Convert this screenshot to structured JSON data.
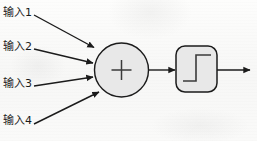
{
  "diagram": {
    "kind": "artificial-neuron-schematic",
    "background_color": "#fbfbfa",
    "stroke_color": "#1b1b1b",
    "node_fill_color": "#e8e8e8",
    "inputs": [
      {
        "id": "in1",
        "label": "输入1"
      },
      {
        "id": "in2",
        "label": "输入2"
      },
      {
        "id": "in3",
        "label": "输入3"
      },
      {
        "id": "in4",
        "label": "输入4"
      }
    ],
    "summation_node": {
      "name": "summation-node",
      "symbol": "+",
      "shape": "circle"
    },
    "activation_node": {
      "name": "activation-function-node",
      "symbol": "step-function",
      "shape": "rounded-rectangle"
    },
    "connections": [
      {
        "from": "in1",
        "to": "summation-node",
        "arrowhead": "solid-triangle"
      },
      {
        "from": "in2",
        "to": "summation-node",
        "arrowhead": "solid-triangle"
      },
      {
        "from": "in3",
        "to": "summation-node",
        "arrowhead": "solid-triangle"
      },
      {
        "from": "in4",
        "to": "summation-node",
        "arrowhead": "solid-triangle"
      },
      {
        "from": "summation-node",
        "to": "activation-function-node",
        "arrowhead": "solid-triangle"
      },
      {
        "from": "activation-function-node",
        "to": "output",
        "arrowhead": "solid-triangle"
      }
    ]
  }
}
